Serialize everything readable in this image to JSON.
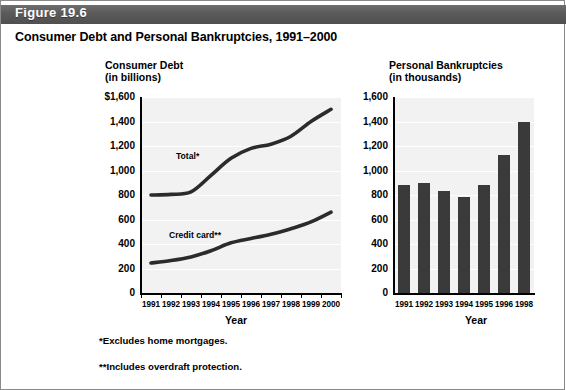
{
  "banner": {
    "figure_label": "Figure 19.6",
    "title": "Consumer Debt and Personal Bankruptcies, 1991–2000"
  },
  "footnotes": {
    "one": "*Excludes home mortgages.",
    "two": "**Includes overdraft protection."
  },
  "colors": {
    "banner": "#5a5a5a",
    "plot_background": "#f2f2f2",
    "gridline": "#ffffff",
    "line": "#2b2b2b",
    "bar": "#3a3a3a",
    "axis": "#000000",
    "text": "#000000"
  },
  "left_chart": {
    "heading_line1": "Consumer Debt",
    "heading_line2": "(in billions)",
    "x_axis_title": "Year",
    "series_labels": {
      "total": "Total*",
      "credit": "Credit card**"
    }
  },
  "right_chart": {
    "heading_line1": "Personal Bankruptcies",
    "heading_line2": "(in thousands)",
    "x_axis_title": "Year"
  },
  "chart_data": [
    {
      "type": "line",
      "title": "Consumer Debt (in billions)",
      "xlabel": "Year",
      "ylabel": "",
      "x": [
        "1991",
        "1992",
        "1993",
        "1994",
        "1995",
        "1996",
        "1997",
        "1998",
        "1999",
        "2000"
      ],
      "ylim": [
        0,
        1600
      ],
      "yticks": [
        0,
        200,
        400,
        600,
        800,
        1000,
        1200,
        1400,
        1600
      ],
      "ytick_labels": [
        "0",
        "200",
        "400",
        "600",
        "800",
        "1,000",
        "1,200",
        "1,400",
        "$1,600"
      ],
      "grid": true,
      "legend": "inline-labels",
      "series": [
        {
          "name": "Total*",
          "values": [
            800,
            805,
            825,
            960,
            1100,
            1180,
            1215,
            1280,
            1400,
            1500
          ]
        },
        {
          "name": "Credit card**",
          "values": [
            245,
            265,
            295,
            345,
            410,
            445,
            480,
            525,
            580,
            660
          ]
        }
      ]
    },
    {
      "type": "bar",
      "title": "Personal Bankruptcies (in thousands)",
      "xlabel": "Year",
      "ylabel": "",
      "categories": [
        "1991",
        "1992",
        "1993",
        "1994",
        "1995",
        "1996",
        "1998"
      ],
      "values": [
        880,
        900,
        830,
        785,
        885,
        1130,
        1400
      ],
      "ylim": [
        0,
        1600
      ],
      "yticks": [
        0,
        200,
        400,
        600,
        800,
        1000,
        1200,
        1400,
        1600
      ],
      "ytick_labels": [
        "0",
        "200",
        "400",
        "600",
        "800",
        "1,000",
        "1,200",
        "1,400",
        "1,600"
      ],
      "grid": true
    }
  ]
}
